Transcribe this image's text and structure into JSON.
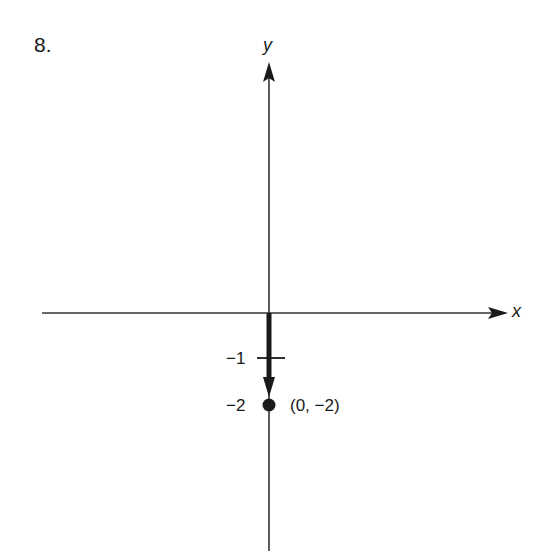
{
  "problem_number": "8.",
  "axes": {
    "x_label": "x",
    "y_label": "y",
    "color": "#1a1a1a"
  },
  "ticks": [
    {
      "value": -1,
      "label": "−1"
    },
    {
      "value": -2,
      "label": "−2"
    }
  ],
  "vector": {
    "from": [
      0,
      0
    ],
    "to": [
      0,
      -2
    ],
    "description": "thick downward arrow from origin"
  },
  "point": {
    "x": 0,
    "y": -2,
    "label": "(0, −2)"
  }
}
